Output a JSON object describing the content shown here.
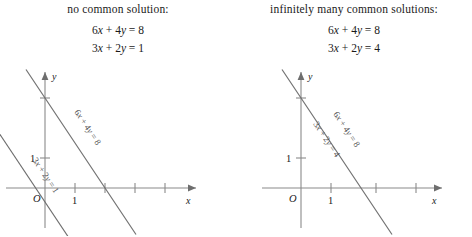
{
  "figure": {
    "type": "diagram",
    "background_color": "#ffffff",
    "line_color": "#6e6e6e",
    "axis_color": "#8a8a8a",
    "text_color": "#1a1a1a"
  },
  "panels": [
    {
      "id": "left",
      "caption": "no common solution:",
      "equations": [
        {
          "lhs_a": "6",
          "var1": "x",
          "op": "+",
          "lhs_b": "4",
          "var2": "y",
          "eq": "=",
          "rhs": "8",
          "text": "6x + 4y = 8"
        },
        {
          "lhs_a": "3",
          "var1": "x",
          "op": "+",
          "lhs_b": "2",
          "var2": "y",
          "eq": "=",
          "rhs": "1",
          "text": "3x + 2y = 1"
        }
      ],
      "axes": {
        "x_label": "x",
        "y_label": "y",
        "origin_label": "O",
        "x_tick_label": "1",
        "y_tick_label": "1",
        "x_ticks": 4,
        "y_ticks": 1
      },
      "lines": [
        {
          "label": "6x + 4y = 8",
          "slope": -1.5,
          "y_intercept": 2,
          "x_intercept": 1.3333
        },
        {
          "label": "3x + 2y = 1",
          "slope": -1.5,
          "y_intercept": 0.5,
          "x_intercept": 0.3333
        }
      ],
      "relationship": "parallel"
    },
    {
      "id": "right",
      "caption": "infinitely many common solutions:",
      "equations": [
        {
          "lhs_a": "6",
          "var1": "x",
          "op": "+",
          "lhs_b": "4",
          "var2": "y",
          "eq": "=",
          "rhs": "8",
          "text": "6x + 4y = 8"
        },
        {
          "lhs_a": "3",
          "var1": "x",
          "op": "+",
          "lhs_b": "2",
          "var2": "y",
          "eq": "=",
          "rhs": "4",
          "text": "3x + 2y = 4"
        }
      ],
      "axes": {
        "x_label": "x",
        "y_label": "y",
        "origin_label": "O",
        "x_tick_label": "1",
        "y_tick_label": "1",
        "x_ticks": 3,
        "y_ticks": 1
      },
      "lines": [
        {
          "label": "6x + 4y = 8",
          "slope": -1.5,
          "y_intercept": 2,
          "x_intercept": 1.3333
        },
        {
          "label": "3x + 2y = 4",
          "slope": -1.5,
          "y_intercept": 2,
          "x_intercept": 1.3333
        }
      ],
      "relationship": "coincident"
    }
  ]
}
